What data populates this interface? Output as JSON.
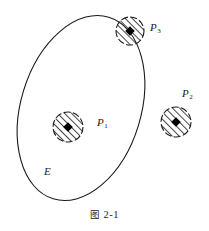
{
  "figure": {
    "caption_cjk": "图",
    "caption_number": "2-1",
    "caption_full": "图 2-1",
    "region_label": "E",
    "points": [
      {
        "id": "P1",
        "label": "P",
        "subscript": "1",
        "cx": 68,
        "cy": 127,
        "r": 15,
        "position": "inside-ellipse"
      },
      {
        "id": "P2",
        "label": "P",
        "subscript": "2",
        "cx": 176,
        "cy": 122,
        "r": 15,
        "position": "outside-ellipse"
      },
      {
        "id": "P3",
        "label": "P",
        "subscript": "3",
        "cx": 130,
        "cy": 31,
        "r": 14,
        "position": "on-ellipse-boundary"
      }
    ],
    "ellipse": {
      "cx": 81,
      "cy": 108,
      "rx": 60,
      "ry": 95,
      "rotation_deg": 17
    },
    "colors": {
      "stroke": "#1a1a1a",
      "fill": "#ffffff",
      "marker": "#000000",
      "background": "#ffffff"
    }
  }
}
